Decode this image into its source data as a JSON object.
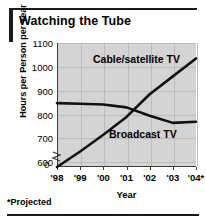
{
  "chart_data": {
    "type": "line",
    "title": "Watching the Tube",
    "xlabel": "Year",
    "ylabel": "Hours per Person per Year",
    "categories": [
      "'98",
      "'99",
      "'00",
      "'01",
      "'02",
      "'03",
      "'04*"
    ],
    "yticks": [
      600,
      700,
      800,
      900,
      1000,
      1100
    ],
    "ylim": [
      580,
      1100
    ],
    "y_axis_break": true,
    "y_axis_break_label": "0",
    "grid": true,
    "legend_position": "inline-labels",
    "footnote": "*Projected",
    "series": [
      {
        "name": "Cable/satellite TV",
        "values": [
          580,
          645,
          715,
          790,
          885,
          960,
          1035
        ],
        "label_anchor": "'01"
      },
      {
        "name": "Broadcast TV",
        "values": [
          848,
          845,
          842,
          830,
          795,
          765,
          770
        ],
        "label_anchor": "'02"
      }
    ],
    "annotations": [
      "Cable/satellite TV",
      "Broadcast TV"
    ]
  },
  "colors": {
    "plot_background": "#d4d4d4",
    "line": "#111111",
    "axis": "#3a3a3a",
    "grid": "#bcbcbc",
    "rule": "#1a1a1a"
  }
}
